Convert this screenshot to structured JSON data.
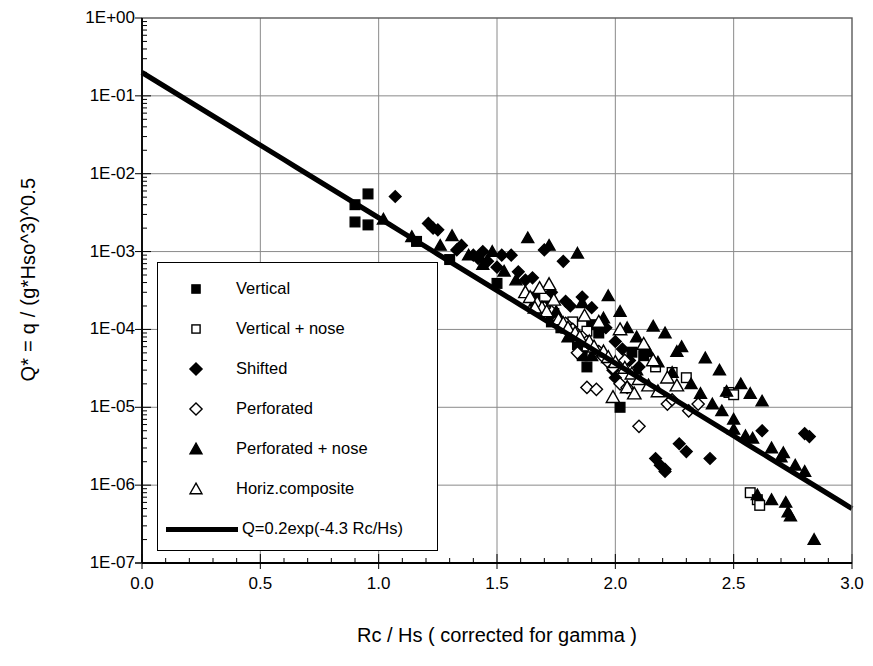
{
  "chart_data": {
    "type": "scatter",
    "title": "",
    "xlabel": "Rc / Hs ( corrected for gamma )",
    "ylabel": "Q* = q / (g*Hso^3)^0.5",
    "xlim": [
      0.0,
      3.0
    ],
    "ylim_log": [
      1e-07,
      1.0
    ],
    "yscale": "log",
    "grid": true,
    "legend_position": "center-left-inside",
    "xticks": [
      "0.0",
      "0.5",
      "1.0",
      "1.5",
      "2.0",
      "2.5",
      "3.0"
    ],
    "xtick_values": [
      0.0,
      0.5,
      1.0,
      1.5,
      2.0,
      2.5,
      3.0
    ],
    "yticks": [
      "1E+00",
      "1E-01",
      "1E-02",
      "1E-03",
      "1E-04",
      "1E-05",
      "1E-06",
      "1E-07"
    ],
    "ytick_values": [
      1,
      0.1,
      0.01,
      0.001,
      0.0001,
      1e-05,
      1e-06,
      1e-07
    ],
    "minor_xtick_step": 0.1,
    "fit_line": {
      "label": "Q=0.2exp(-4.3 Rc/Hs)",
      "prefactor": 0.2,
      "exponent_coefficient": -4.3,
      "x_start": 0.0,
      "x_end": 3.0,
      "y_start": 0.2,
      "y_end": 5.2e-07
    },
    "series": [
      {
        "name": "Vertical",
        "marker": "filled-square",
        "points": [
          [
            0.9,
            0.004
          ],
          [
            0.9,
            0.0024
          ],
          [
            0.955,
            0.0055
          ],
          [
            0.955,
            0.0022
          ],
          [
            1.16,
            0.00135
          ],
          [
            1.3,
            0.00079
          ],
          [
            1.5,
            0.00039
          ],
          [
            1.73,
            0.000125
          ],
          [
            1.74,
            0.00016
          ],
          [
            1.77,
            0.000105
          ],
          [
            1.84,
            6.4e-05
          ],
          [
            1.86,
            4.6e-05
          ],
          [
            1.88,
            3.3e-05
          ],
          [
            1.9,
            0.000115
          ],
          [
            1.93,
            9e-05
          ],
          [
            2.02,
            1e-05
          ],
          [
            2.07,
            5.1e-05
          ],
          [
            2.12,
            4.6e-05
          ],
          [
            1.66,
            0.00026
          ],
          [
            1.71,
            0.0002
          ]
        ]
      },
      {
        "name": "Vertical + nose",
        "marker": "open-square",
        "points": [
          [
            2.17,
            3.3e-05
          ],
          [
            2.24,
            2.8e-05
          ],
          [
            2.3,
            2.4e-05
          ],
          [
            2.48,
            1.55e-05
          ],
          [
            2.5,
            1.45e-05
          ],
          [
            2.57,
            8e-07
          ],
          [
            2.6,
            6.5e-07
          ],
          [
            2.61,
            5.5e-07
          ],
          [
            1.82,
            0.000125
          ],
          [
            1.88,
            9.5e-05
          ]
        ]
      },
      {
        "name": "Shifted",
        "marker": "filled-diamond",
        "points": [
          [
            1.07,
            0.0051
          ],
          [
            1.21,
            0.0023
          ],
          [
            1.23,
            0.002
          ],
          [
            1.25,
            0.0019
          ],
          [
            1.33,
            0.00105
          ],
          [
            1.35,
            0.0012
          ],
          [
            1.4,
            0.0009
          ],
          [
            1.42,
            0.00082
          ],
          [
            1.44,
            0.001
          ],
          [
            1.46,
            0.00075
          ],
          [
            1.5,
            0.00063
          ],
          [
            1.52,
            0.0009
          ],
          [
            1.56,
            0.0009
          ],
          [
            1.59,
            0.00055
          ],
          [
            1.62,
            0.00043
          ],
          [
            1.65,
            0.00046
          ],
          [
            1.7,
            0.00105
          ],
          [
            1.73,
            0.0003
          ],
          [
            1.78,
            0.00075
          ],
          [
            1.79,
            0.00023
          ],
          [
            1.81,
            0.0002
          ],
          [
            1.86,
            0.00026
          ],
          [
            1.9,
            0.00019
          ],
          [
            1.94,
            0.00012
          ],
          [
            1.96,
            0.000105
          ],
          [
            2.0,
            7e-05
          ],
          [
            2.03,
            5.6e-05
          ],
          [
            2.06,
            4e-05
          ],
          [
            2.1,
            3.3e-05
          ],
          [
            2.17,
            2.2e-06
          ],
          [
            2.19,
            1.8e-06
          ],
          [
            2.21,
            1.6e-06
          ],
          [
            2.21,
            1.5e-06
          ],
          [
            2.27,
            3.4e-06
          ],
          [
            2.3,
            2.7e-06
          ],
          [
            2.4,
            2.2e-06
          ],
          [
            2.8,
            4.6e-06
          ],
          [
            2.82,
            4.2e-06
          ],
          [
            2.62,
            5e-06
          ],
          [
            2.12,
            5.7e-05
          ],
          [
            1.99,
            3e-05
          ],
          [
            2.0,
            2.4e-05
          ]
        ]
      },
      {
        "name": "Perforated",
        "marker": "open-diamond",
        "points": [
          [
            1.82,
            0.0001
          ],
          [
            1.86,
            8e-05
          ],
          [
            1.88,
            7e-05
          ],
          [
            1.9,
            6e-05
          ],
          [
            1.93,
            5.2e-05
          ],
          [
            1.95,
            4.4e-05
          ],
          [
            1.97,
            3.8e-05
          ],
          [
            1.99,
            3.2e-05
          ],
          [
            1.76,
            0.000135
          ],
          [
            1.79,
            0.00012
          ],
          [
            1.73,
            0.00017
          ],
          [
            1.7,
            0.00019
          ],
          [
            2.02,
            2e-05
          ],
          [
            2.05,
            1.8e-05
          ],
          [
            2.22,
            1.1e-05
          ],
          [
            2.31,
            9e-06
          ],
          [
            2.35,
            1.1e-05
          ],
          [
            2.1,
            5.7e-06
          ],
          [
            1.88,
            1.8e-05
          ],
          [
            1.92,
            1.7e-05
          ],
          [
            2.04,
            4e-05
          ],
          [
            1.84,
            5e-05
          ],
          [
            2.24,
            1.25e-05
          ]
        ]
      },
      {
        "name": "Perforated + nose",
        "marker": "filled-triangle",
        "points": [
          [
            1.02,
            0.0026
          ],
          [
            1.14,
            0.00155
          ],
          [
            1.26,
            0.0012
          ],
          [
            1.31,
            0.0016
          ],
          [
            1.38,
            0.0009
          ],
          [
            1.44,
            0.00068
          ],
          [
            1.48,
            0.001
          ],
          [
            1.53,
            0.00056
          ],
          [
            1.58,
            0.00043
          ],
          [
            1.63,
            0.0015
          ],
          [
            1.66,
            0.00023
          ],
          [
            1.72,
            0.0012
          ],
          [
            1.75,
            0.00017
          ],
          [
            1.8,
            8e-05
          ],
          [
            1.84,
            0.00095
          ],
          [
            1.86,
            0.00022
          ],
          [
            1.9,
            4.6e-05
          ],
          [
            1.95,
            0.00014
          ],
          [
            2.02,
            0.00017
          ],
          [
            2.05,
            0.000105
          ],
          [
            2.09,
            8e-05
          ],
          [
            2.14,
            5.2e-05
          ],
          [
            2.18,
            3.8e-05
          ],
          [
            2.24,
            2.8e-05
          ],
          [
            2.26,
            5.2e-05
          ],
          [
            2.32,
            2e-05
          ],
          [
            2.36,
            1.5e-05
          ],
          [
            2.41,
            1.1e-05
          ],
          [
            2.45,
            9e-06
          ],
          [
            2.47,
            1.6e-05
          ],
          [
            2.5,
            7e-06
          ],
          [
            2.53,
            2e-05
          ],
          [
            2.57,
            1.5e-05
          ],
          [
            2.58,
            4e-06
          ],
          [
            2.62,
            1.2e-05
          ],
          [
            2.66,
            3e-06
          ],
          [
            2.7,
            2.3e-06
          ],
          [
            2.72,
            6e-07
          ],
          [
            2.73,
            4.5e-07
          ],
          [
            2.74,
            4e-07
          ],
          [
            2.76,
            1.8e-06
          ],
          [
            2.8,
            1.5e-06
          ],
          [
            2.84,
            2e-07
          ],
          [
            2.5,
            5.2e-06
          ],
          [
            2.55,
            4.3e-06
          ],
          [
            2.44,
            3e-05
          ],
          [
            2.38,
            4.3e-05
          ],
          [
            2.28,
            6e-05
          ],
          [
            2.21,
            9e-05
          ],
          [
            2.16,
            0.00011
          ],
          [
            2.6,
            7.5e-07
          ],
          [
            2.66,
            6.5e-07
          ],
          [
            2.71,
            2.6e-06
          ],
          [
            1.97,
            0.00027
          ],
          [
            2.09,
            3e-05
          ]
        ]
      },
      {
        "name": "Horiz.composite",
        "marker": "open-triangle",
        "points": [
          [
            1.62,
            0.0003
          ],
          [
            1.64,
            0.00026
          ],
          [
            1.67,
            0.00022
          ],
          [
            1.69,
            0.00019
          ],
          [
            1.71,
            0.00017
          ],
          [
            1.74,
            0.00024
          ],
          [
            1.76,
            0.000135
          ],
          [
            1.78,
            0.00012
          ],
          [
            1.8,
            0.000105
          ],
          [
            1.83,
            9e-05
          ],
          [
            1.85,
            8e-05
          ],
          [
            1.87,
            0.00015
          ],
          [
            1.89,
            7e-05
          ],
          [
            1.91,
            6e-05
          ],
          [
            1.93,
            0.000125
          ],
          [
            1.95,
            5.2e-05
          ],
          [
            1.97,
            4.4e-05
          ],
          [
            2.0,
            3.8e-05
          ],
          [
            2.02,
            0.0001
          ],
          [
            2.04,
            3.2e-05
          ],
          [
            2.07,
            2.7e-05
          ],
          [
            2.1,
            2.3e-05
          ],
          [
            2.12,
            6.5e-05
          ],
          [
            2.14,
            1.9e-05
          ],
          [
            2.18,
            1.6e-05
          ],
          [
            2.22,
            2.4e-05
          ],
          [
            2.05,
            1.8e-05
          ],
          [
            2.08,
            1.5e-05
          ],
          [
            1.72,
            0.00038
          ],
          [
            1.68,
            0.00034
          ],
          [
            1.99,
            1.35e-05
          ],
          [
            1.66,
            0.00019
          ],
          [
            2.16,
            4e-05
          ],
          [
            2.26,
            1.9e-05
          ]
        ]
      }
    ]
  },
  "legend": {
    "entries": [
      {
        "label": "Vertical",
        "marker": "filled-square"
      },
      {
        "label": "Vertical + nose",
        "marker": "open-square"
      },
      {
        "label": "Shifted",
        "marker": "filled-diamond"
      },
      {
        "label": "Perforated",
        "marker": "open-diamond"
      },
      {
        "label": "Perforated + nose",
        "marker": "filled-triangle"
      },
      {
        "label": "Horiz.composite",
        "marker": "open-triangle"
      },
      {
        "label": "Q=0.2exp(-4.3 Rc/Hs)",
        "marker": "line"
      }
    ]
  },
  "colors": {
    "ink": "#000000",
    "grid": "#808080",
    "background": "#ffffff"
  }
}
